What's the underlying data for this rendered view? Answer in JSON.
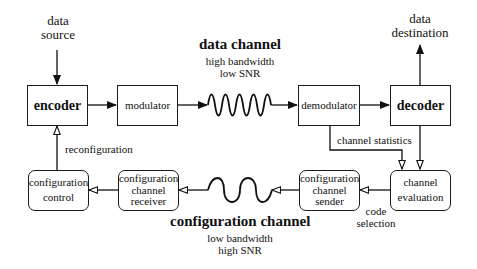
{
  "diagram": {
    "nodes": {
      "encoder": {
        "label": "encoder"
      },
      "modulator": {
        "label": "modulator"
      },
      "demodulator": {
        "label": "demodulator"
      },
      "decoder": {
        "label": "decoder"
      },
      "configuration_control": {
        "line1": "configuration",
        "line2": "control"
      },
      "configuration_channel_receiver": {
        "line1": "configuration",
        "line2": "channel",
        "line3": "receiver"
      },
      "configuration_channel_sender": {
        "line1": "configuration",
        "line2": "channel",
        "line3": "sender"
      },
      "channel_evaluation": {
        "line1": "channel",
        "line2": "evaluation"
      }
    },
    "labels": {
      "data_source": {
        "line1": "data",
        "line2": "source"
      },
      "data_destination": {
        "line1": "data",
        "line2": "destination"
      },
      "data_channel": {
        "title": "data channel",
        "line1": "high bandwidth",
        "line2": "low SNR"
      },
      "configuration_channel": {
        "title": "configuration channel",
        "line1": "low bandwidth",
        "line2": "high SNR"
      },
      "reconfiguration": "reconfiguration",
      "channel_statistics": "channel statistics",
      "code_selection": {
        "line1": "code",
        "line2": "selection"
      }
    },
    "edges": [
      {
        "from": "data source",
        "to": "encoder"
      },
      {
        "from": "encoder",
        "to": "modulator"
      },
      {
        "from": "modulator",
        "to": "demodulator",
        "via": "data channel"
      },
      {
        "from": "demodulator",
        "to": "decoder"
      },
      {
        "from": "decoder",
        "to": "data destination"
      },
      {
        "from": "demodulator",
        "to": "channel evaluation",
        "label": "channel statistics"
      },
      {
        "from": "decoder",
        "to": "channel evaluation"
      },
      {
        "from": "channel evaluation",
        "to": "configuration channel sender",
        "label": "code selection"
      },
      {
        "from": "configuration channel sender",
        "to": "configuration channel receiver",
        "via": "configuration channel"
      },
      {
        "from": "configuration channel receiver",
        "to": "configuration control"
      },
      {
        "from": "configuration control",
        "to": "encoder",
        "label": "reconfiguration"
      }
    ]
  }
}
